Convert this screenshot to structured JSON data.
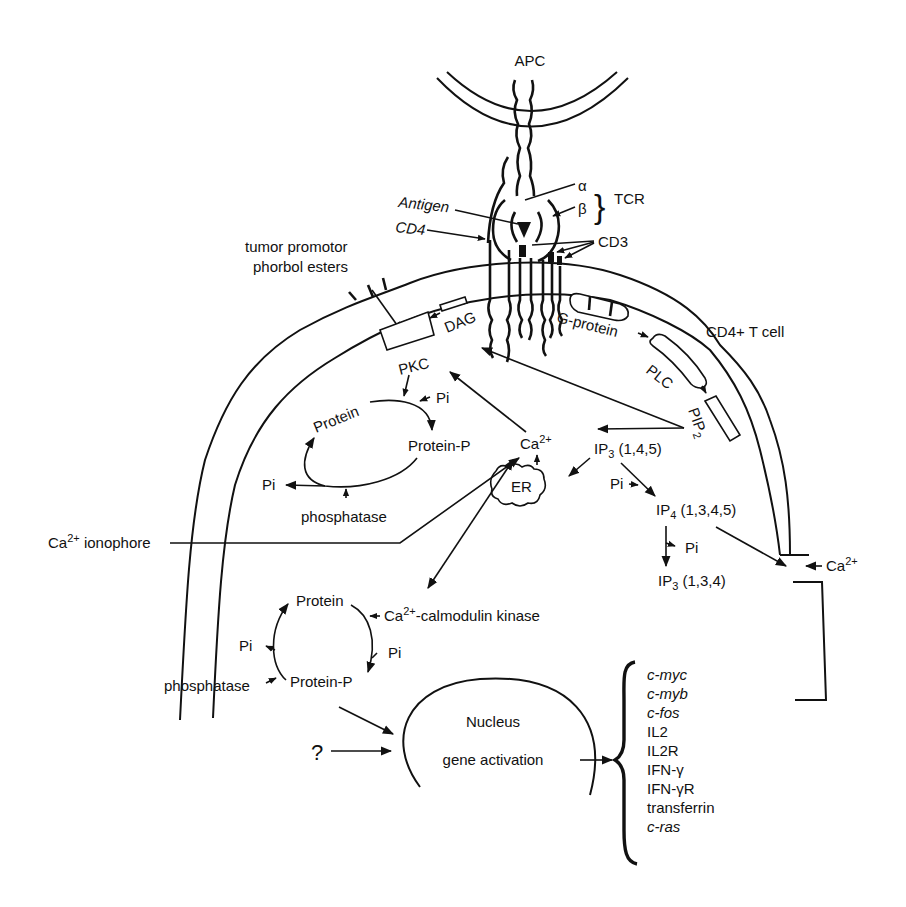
{
  "figure": {
    "cells": {
      "apc": "APC",
      "t_cell": "CD4+ T cell"
    },
    "receptor": {
      "alpha": "α",
      "beta": "β",
      "tcr": "TCR",
      "antigen": "Antigen",
      "cd4": "CD4",
      "cd3": "CD3"
    },
    "membrane_components": {
      "tumor_promotor_line1": "tumor promotor",
      "tumor_promotor_line2": "phorbol esters",
      "pkc": "PKC",
      "dag": "DAG",
      "g_protein": "G-protein",
      "plc": "PLC",
      "pip2_base": "PIP",
      "pip2_sub": "2"
    },
    "pkc_cycle": {
      "protein": "Protein",
      "pi_in": "Pi",
      "protein_p": "Protein-P",
      "pi_out": "Pi",
      "phosphatase": "phosphatase"
    },
    "calcium": {
      "ca_base": "Ca",
      "ca_sup": "2+",
      "er": "ER",
      "ionophore_base": "Ca",
      "ionophore_sup": "2+",
      "ionophore_rest": " ionophore",
      "extracellular_base": "Ca",
      "extracellular_sup": "2+"
    },
    "inositol": {
      "ip3_base": "IP",
      "ip3_sub": "3",
      "ip3_pos": " (1,4,5)",
      "pi_1": "Pi",
      "ip4_base": "IP",
      "ip4_sub": "4",
      "ip4_pos": " (1,3,4,5)",
      "pi_2": "Pi",
      "ip3b_base": "IP",
      "ip3b_sub": "3",
      "ip3b_pos": " (1,3,4)"
    },
    "calmodulin_cycle": {
      "protein": "Protein",
      "kinase_base": "Ca",
      "kinase_sup": "2+",
      "kinase_rest": "-calmodulin kinase",
      "pi_right": "Pi",
      "pi_left": "Pi",
      "protein_p": "Protein-P",
      "phosphatase": "phosphatase"
    },
    "nucleus": {
      "title": "Nucleus",
      "subtitle": "gene activation",
      "unknown_input": "?"
    },
    "genes": [
      {
        "name": "c-myc",
        "italic": true
      },
      {
        "name": "c-myb",
        "italic": true
      },
      {
        "name": "c-fos",
        "italic": true
      },
      {
        "name": "IL2",
        "italic": false
      },
      {
        "name": "IL2R",
        "italic": false
      },
      {
        "name": "IFN-γ",
        "italic": false
      },
      {
        "name": "IFN-γR",
        "italic": false
      },
      {
        "name": "transferrin",
        "italic": false
      },
      {
        "name": "c-ras",
        "italic": true
      }
    ],
    "colors": {
      "ink": "#111111",
      "background": "#ffffff"
    }
  }
}
